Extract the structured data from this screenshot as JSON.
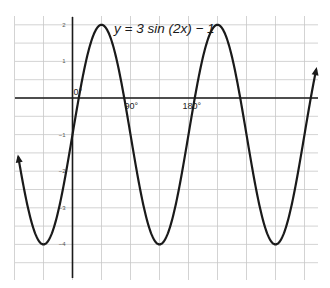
{
  "chart_data": {
    "type": "line",
    "title": "y = 3 sin (2x) − 1",
    "xlabel": "",
    "ylabel": "",
    "x_unit": "degrees",
    "xlim": [
      -90,
      400
    ],
    "ylim": [
      -5,
      2.1
    ],
    "grid": true,
    "x_tick_labels": [
      {
        "value": 0,
        "label": "0°"
      },
      {
        "value": 90,
        "label": "90°"
      },
      {
        "value": 180,
        "label": "180°"
      }
    ],
    "y_tick_labels": [
      {
        "value": 2,
        "label": "2"
      },
      {
        "value": 1,
        "label": "1"
      },
      {
        "value": -1,
        "label": "−1"
      },
      {
        "value": -2,
        "label": "−2"
      },
      {
        "value": -3,
        "label": "−3"
      },
      {
        "value": -4,
        "label": "−4"
      }
    ],
    "series": [
      {
        "name": "y = 3 sin(2x) − 1",
        "function": "3*sin(2x)-1",
        "x": [
          -84,
          -45,
          0,
          45,
          90,
          135,
          180,
          225,
          270,
          315,
          360,
          378
        ],
        "values": [
          -1.62,
          -4,
          -1,
          2,
          -1,
          -4,
          -1,
          2,
          -1,
          -4,
          -1,
          0.76
        ],
        "arrows_both_ends": true
      }
    ],
    "key_points": {
      "maxima": [
        [
          45,
          2
        ],
        [
          225,
          2
        ]
      ],
      "minima": [
        [
          -45,
          -4
        ],
        [
          135,
          -4
        ],
        [
          315,
          -4
        ]
      ]
    }
  }
}
